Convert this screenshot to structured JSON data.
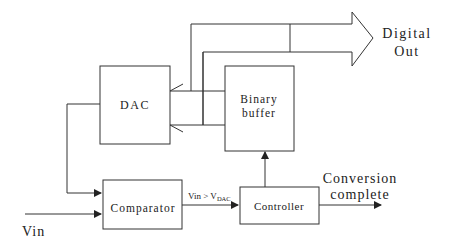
{
  "diagram": {
    "type": "block-diagram",
    "blocks": {
      "dac": {
        "label": "DAC"
      },
      "buffer": {
        "label_line1": "Binary",
        "label_line2": "buffer"
      },
      "comparator": {
        "label": "Comparator"
      },
      "controller": {
        "label": "Controller"
      }
    },
    "signals": {
      "vin": "Vin",
      "compare_prefix": "Vin > V",
      "compare_subscript": "DAC",
      "digital_out_line1": "Digital",
      "digital_out_line2": "Out",
      "conversion_line1": "Conversion",
      "conversion_line2": "complete"
    },
    "colors": {
      "stroke": "#333333",
      "text": "#222222",
      "background": "#ffffff"
    }
  }
}
